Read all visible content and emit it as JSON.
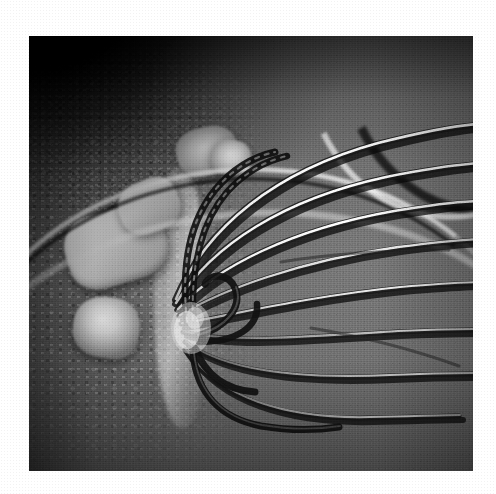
{
  "image": {
    "kind": "photograph",
    "subject": "balloon whisk in a mixing bowl with butter and flour mixture",
    "palette": "grayscale",
    "caption": "",
    "border_color": "#ffffff",
    "photo": {
      "left": 29,
      "top": 36,
      "width": 444,
      "height": 435,
      "background_color": "#6a6a6a",
      "shadow_color": "#0a0a0a",
      "highlight_color": "#f2f2f2"
    },
    "elements": [
      {
        "id": "whisk",
        "label": "balloon whisk",
        "material": "stainless steel",
        "wire_count": 8
      },
      {
        "id": "bowl-rim",
        "label": "mixing bowl rim",
        "material": "metal"
      },
      {
        "id": "butter-chunks",
        "label": "pale butter chunks",
        "count": 4
      },
      {
        "id": "flour-mixture",
        "label": "crumbly flour mixture"
      },
      {
        "id": "shadow-corner",
        "label": "shadowed bowl wall",
        "corner": "top-left"
      }
    ]
  },
  "whisk": {
    "hub_x": 175,
    "hub_y": 285,
    "wires": [
      {
        "id": "wire-1",
        "highlight": "bright"
      },
      {
        "id": "wire-2",
        "highlight": "bright"
      },
      {
        "id": "wire-3",
        "highlight": "bright"
      },
      {
        "id": "wire-4",
        "highlight": "medium"
      },
      {
        "id": "wire-5",
        "highlight": "medium"
      },
      {
        "id": "wire-6",
        "highlight": "dim"
      },
      {
        "id": "wire-7",
        "highlight": "dim"
      },
      {
        "id": "wire-8",
        "highlight": "dim"
      }
    ]
  }
}
